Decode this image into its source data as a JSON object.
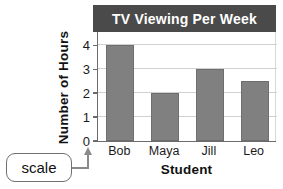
{
  "chart_data": {
    "type": "bar",
    "title": "TV Viewing Per Week",
    "xlabel": "Student",
    "ylabel": "Number of Hours",
    "categories": [
      "Bob",
      "Maya",
      "Jill",
      "Leo"
    ],
    "values": [
      4,
      2,
      3,
      2.5
    ],
    "yticks": [
      "0",
      "1",
      "2",
      "3",
      "4"
    ],
    "ylim": [
      0,
      4.6
    ],
    "grid": true,
    "legend": "none",
    "bar_color": "#808080",
    "title_bar_color": "#4a4a4a",
    "title_text_color": "#ffffff",
    "gridline_color": "#d0d0d0",
    "axis_color": "#6b6b6b"
  },
  "annotation": {
    "callout_label": "scale",
    "pointer_icon": "up-arrow-icon"
  }
}
